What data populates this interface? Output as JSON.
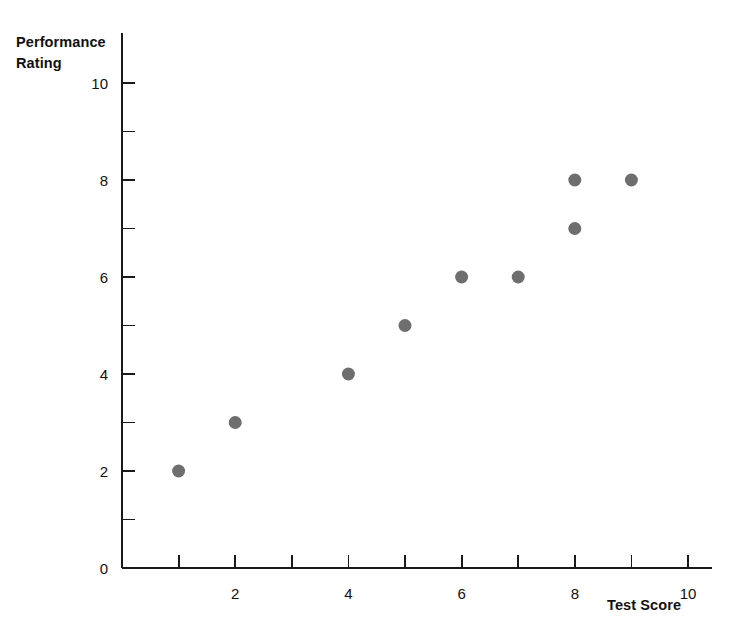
{
  "chart_data": {
    "type": "scatter",
    "title": "",
    "xlabel": "Test Score",
    "ylabel": "Performance Rating",
    "ylabel_lines": [
      "Performance",
      "Rating"
    ],
    "xlim": [
      0,
      10.4
    ],
    "ylim": [
      0,
      10.5
    ],
    "grid": false,
    "legend": null,
    "marker": {
      "shape": "circle",
      "color": "#6e6e6e",
      "size_px": 13
    },
    "x_ticks_major": [
      2,
      4,
      6,
      8,
      10
    ],
    "x_ticks_minor": [
      1,
      3,
      5,
      7,
      9
    ],
    "x_tick_labels": [
      "2",
      "4",
      "6",
      "8",
      "10"
    ],
    "y_ticks_major": [
      0,
      2,
      4,
      6,
      8,
      10
    ],
    "y_ticks_minor": [
      1,
      3,
      5,
      7,
      9
    ],
    "y_tick_labels": [
      "0",
      "2",
      "4",
      "6",
      "8",
      "10"
    ],
    "points": [
      {
        "x": 1,
        "y": 2
      },
      {
        "x": 2,
        "y": 3
      },
      {
        "x": 4,
        "y": 4
      },
      {
        "x": 5,
        "y": 5
      },
      {
        "x": 6,
        "y": 6
      },
      {
        "x": 7,
        "y": 6
      },
      {
        "x": 8,
        "y": 7
      },
      {
        "x": 8,
        "y": 8
      },
      {
        "x": 9,
        "y": 8
      }
    ]
  },
  "colors": {
    "marker": "#6e6e6e",
    "axis": "#1a1a1a",
    "text": "#111111",
    "background": "#ffffff"
  }
}
